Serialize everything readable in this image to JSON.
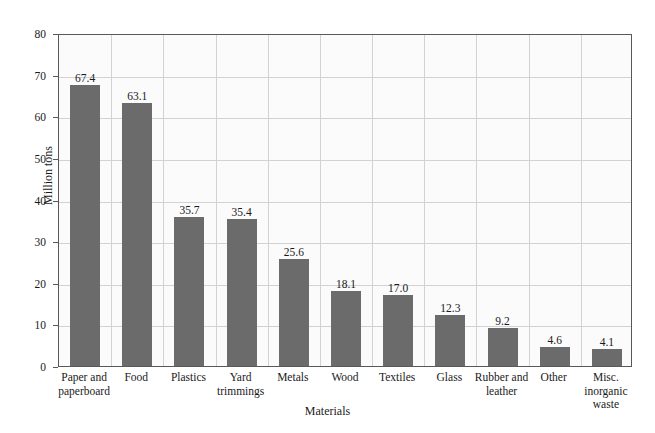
{
  "chart_data": {
    "type": "bar",
    "title": "",
    "xlabel": "Materials",
    "ylabel": "Million tons",
    "ylim": [
      0,
      80
    ],
    "ytick_labels": [
      "0",
      "10",
      "20",
      "30",
      "40",
      "50",
      "60",
      "70",
      "80"
    ],
    "yticks": [
      0,
      10,
      20,
      30,
      40,
      50,
      60,
      70,
      80
    ],
    "grid": "both",
    "legend": "none",
    "bar_color": "#6b6b6b",
    "categories": [
      "Paper and paperboard",
      "Food",
      "Plastics",
      "Yard trimmings",
      "Metals",
      "Wood",
      "Textiles",
      "Glass",
      "Rubber and leather",
      "Other",
      "Misc. inorganic waste"
    ],
    "category_lines": [
      [
        "Paper and",
        "paperboard"
      ],
      [
        "Food"
      ],
      [
        "Plastics"
      ],
      [
        "Yard",
        "trimmings"
      ],
      [
        "Metals"
      ],
      [
        "Wood"
      ],
      [
        "Textiles"
      ],
      [
        "Glass"
      ],
      [
        "Rubber and",
        "leather"
      ],
      [
        "Other"
      ],
      [
        "Misc.",
        "inorganic",
        "waste"
      ]
    ],
    "values": [
      67.4,
      63.1,
      35.7,
      35.4,
      25.6,
      18.1,
      17.0,
      12.3,
      9.2,
      4.6,
      4.1
    ],
    "value_labels": [
      "67.4",
      "63.1",
      "35.7",
      "35.4",
      "25.6",
      "18.1",
      "17.0",
      "12.3",
      "9.2",
      "4.6",
      "4.1"
    ]
  }
}
